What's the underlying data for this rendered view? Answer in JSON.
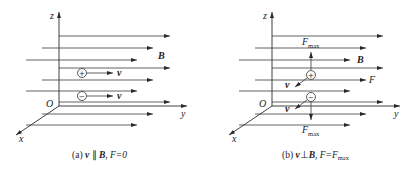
{
  "panel_a": {
    "axes": {
      "z": "z",
      "y": "y",
      "x": "x",
      "origin": "O"
    },
    "field_label": "B",
    "particles": [
      {
        "charge": "+",
        "velocity_label": "v"
      },
      {
        "charge": "−",
        "velocity_label": "v"
      }
    ],
    "caption": {
      "prefix": "(a) ",
      "v": "v",
      "rel": " ∥ ",
      "B": "B",
      "rest": ", F=0"
    }
  },
  "panel_b": {
    "axes": {
      "z": "z",
      "y": "y",
      "x": "x",
      "origin": "O"
    },
    "field_label": "B",
    "force_label": "F",
    "force_max_top": {
      "main": "F",
      "sub": "max"
    },
    "force_max_bottom": {
      "main": "F",
      "sub": "max"
    },
    "particles": [
      {
        "charge": "+",
        "velocity_label": "v"
      },
      {
        "charge": "−",
        "velocity_label": "v"
      }
    ],
    "caption": {
      "prefix": "(b) ",
      "v": "v",
      "rel": "⊥",
      "B": "B",
      "rest": ", F=F",
      "sub": "max"
    }
  }
}
